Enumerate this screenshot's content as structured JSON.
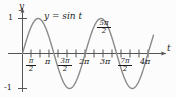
{
  "figure": {
    "name": "sine-function-graph",
    "background_color": "#fcfcfc",
    "curve_color": "#8a8a8a",
    "axis_color": "#555555",
    "text_color": "#1c1c1c"
  },
  "axes": {
    "y_axis_label": "y",
    "x_axis_label": "t",
    "y_tick_top": "1",
    "y_tick_bottom": "-1"
  },
  "equation": {
    "lhs": "y",
    "eq": " = ",
    "rhs": "sin t",
    "full": "y = sin t"
  },
  "x_ticks": [
    {
      "label": "π/2",
      "num": "π",
      "den": "2",
      "stacked": true,
      "value": 1.5707963,
      "position": "below"
    },
    {
      "label": "π",
      "num": "π",
      "den": "",
      "stacked": false,
      "value": 3.1415927,
      "position": "below"
    },
    {
      "label": "3π/2",
      "num": "3π",
      "den": "2",
      "stacked": true,
      "value": 4.712389,
      "position": "below"
    },
    {
      "label": "2π",
      "num": "2π",
      "den": "",
      "stacked": false,
      "value": 6.2831853,
      "position": "below"
    },
    {
      "label": "5π/2",
      "num": "5π",
      "den": "2",
      "stacked": true,
      "value": 7.8539816,
      "position": "above"
    },
    {
      "label": "3π",
      "num": "3π",
      "den": "",
      "stacked": false,
      "value": 9.424778,
      "position": "below"
    },
    {
      "label": "7π/2",
      "num": "7π",
      "den": "2",
      "stacked": true,
      "value": 10.9955743,
      "position": "below"
    },
    {
      "label": "4π",
      "num": "4π",
      "den": "",
      "stacked": false,
      "value": 12.5663706,
      "position": "below"
    }
  ],
  "chart_data": {
    "type": "line",
    "title": "",
    "subtitle": "",
    "xlabel": "t",
    "ylabel": "y",
    "grid": false,
    "legend": "none",
    "annotations": [
      "y = sin t"
    ],
    "xlim": [
      0,
      12.5663706
    ],
    "ylim": [
      -1,
      1
    ],
    "xtick_labels": [
      "π/2",
      "π",
      "3π/2",
      "2π",
      "5π/2",
      "3π",
      "7π/2",
      "4π"
    ],
    "xtick_values": [
      1.5707963,
      3.1415927,
      4.712389,
      6.2831853,
      7.8539816,
      9.424778,
      10.9955743,
      12.5663706
    ],
    "ytick_labels": [
      "1",
      "-1"
    ],
    "ytick_values": [
      1,
      -1
    ],
    "series": [
      {
        "name": "y = sin t",
        "formula": "y = sin(t)",
        "amplitude": 1,
        "period": 6.2831853,
        "x": [
          0,
          0.3926991,
          0.7853982,
          1.1780972,
          1.5707963,
          1.9634954,
          2.3561945,
          2.7488936,
          3.1415927,
          3.5342917,
          3.9269908,
          4.3196899,
          4.712389,
          5.1050881,
          5.4977871,
          5.8904862,
          6.2831853,
          6.6758844,
          7.0685835,
          7.4612826,
          7.8539816,
          8.2466807,
          8.6393798,
          9.0320789,
          9.424778,
          9.817477,
          10.2101761,
          10.6028752,
          10.9955743,
          11.3882734,
          11.7809725,
          12.1736715,
          12.5663706
        ],
        "y": [
          0,
          0.3826834,
          0.7071068,
          0.9238795,
          1,
          0.9238795,
          0.7071068,
          0.3826834,
          0,
          -0.3826834,
          -0.7071068,
          -0.9238795,
          -1,
          -0.9238795,
          -0.7071068,
          -0.3826834,
          0,
          0.3826834,
          0.7071068,
          0.9238795,
          1,
          0.9238795,
          0.7071068,
          0.3826834,
          0,
          -0.3826834,
          -0.7071068,
          -0.9238795,
          -1,
          -0.9238795,
          -0.7071068,
          -0.3826834,
          0
        ]
      }
    ]
  }
}
